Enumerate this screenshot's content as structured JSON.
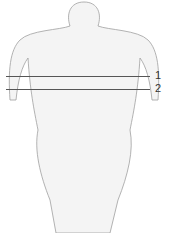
{
  "diagram": {
    "reference_lines": [
      {
        "label": "1",
        "y": 76,
        "x_start": 6,
        "x_end": 150
      },
      {
        "label": "2",
        "y": 89,
        "x_start": 6,
        "x_end": 150
      }
    ],
    "colors": {
      "line": "#555555",
      "outline": "#9a9a9a",
      "fill": "#f2f2f2"
    }
  }
}
